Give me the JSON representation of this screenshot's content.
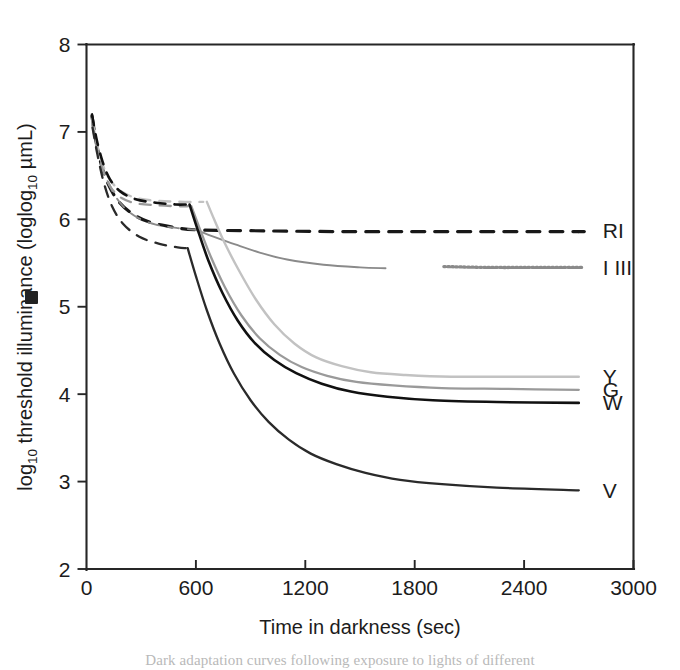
{
  "figure": {
    "caption_partial": "Dark adaptation curves following exposure to lights of different"
  },
  "chart_data": {
    "type": "line",
    "title": "",
    "xlabel": "Time in darkness (sec)",
    "ylabel": "log",
    "ylabel_sub1": "10",
    "ylabel_mid": " threshold  illuminance (log",
    "ylabel_sub2": "10",
    "ylabel_end": " µmL)",
    "ylabel_full": "log10 threshold illuminance (log10 µmL)",
    "xlim": [
      0,
      3000
    ],
    "ylim": [
      2,
      8
    ],
    "xticks": [
      0,
      600,
      1200,
      1800,
      2400,
      3000
    ],
    "yticks": [
      2,
      3,
      4,
      5,
      6,
      7,
      8
    ],
    "xtick_labels": [
      "0",
      "600",
      "1200",
      "1800",
      "2400",
      "3000"
    ],
    "ytick_labels": [
      "2",
      "3",
      "4",
      "5",
      "6",
      "7",
      "8"
    ],
    "grid": false,
    "legend_position": "right-inline-labels",
    "series": [
      {
        "name": "RI",
        "label": "RI",
        "color": "#181818",
        "style": "dashed",
        "width": 3.2,
        "label_x": 2755,
        "label_y": 5.87,
        "cone_points": [
          [
            30,
            7.18
          ],
          [
            55,
            6.86
          ],
          [
            85,
            6.6
          ],
          [
            120,
            6.4
          ],
          [
            170,
            6.22
          ],
          [
            240,
            6.08
          ],
          [
            330,
            5.98
          ],
          [
            450,
            5.92
          ],
          [
            600,
            5.88
          ],
          [
            900,
            5.87
          ],
          [
            1400,
            5.86
          ],
          [
            2000,
            5.86
          ],
          [
            2700,
            5.86
          ]
        ],
        "plateau": 5.86
      },
      {
        "name": "I III",
        "label": "I III",
        "color": "#8a8a8a",
        "style": "solid-then-dotted",
        "width": 1.9,
        "label_x": 2755,
        "label_y": 5.45,
        "cone_points": [
          [
            35,
            7.1
          ],
          [
            60,
            6.82
          ],
          [
            95,
            6.55
          ],
          [
            140,
            6.33
          ],
          [
            200,
            6.15
          ],
          [
            280,
            6.02
          ],
          [
            380,
            5.94
          ],
          [
            500,
            5.9
          ],
          [
            600,
            5.88
          ]
        ],
        "rod_points": [
          [
            600,
            5.88
          ],
          [
            700,
            5.8
          ],
          [
            820,
            5.71
          ],
          [
            950,
            5.62
          ],
          [
            1100,
            5.54
          ],
          [
            1300,
            5.48
          ],
          [
            1500,
            5.45
          ],
          [
            1640,
            5.44
          ]
        ],
        "dotted_points": [
          [
            1960,
            5.46
          ],
          [
            2200,
            5.45
          ],
          [
            2500,
            5.45
          ],
          [
            2720,
            5.45
          ]
        ],
        "plateau": 5.45
      },
      {
        "name": "Y",
        "label": "Y",
        "color": "#c2c2c2",
        "style": "solid",
        "width": 2.4,
        "label_x": 2755,
        "label_y": 4.2,
        "cone_points": [
          [
            30,
            7.15
          ],
          [
            55,
            6.88
          ],
          [
            90,
            6.62
          ],
          [
            130,
            6.45
          ],
          [
            190,
            6.32
          ],
          [
            280,
            6.24
          ],
          [
            400,
            6.21
          ],
          [
            540,
            6.2
          ],
          [
            640,
            6.2
          ]
        ],
        "rod_points": [
          [
            660,
            6.2
          ],
          [
            700,
            6.0
          ],
          [
            760,
            5.72
          ],
          [
            840,
            5.4
          ],
          [
            930,
            5.08
          ],
          [
            1030,
            4.8
          ],
          [
            1140,
            4.58
          ],
          [
            1260,
            4.42
          ],
          [
            1400,
            4.32
          ],
          [
            1560,
            4.25
          ],
          [
            1750,
            4.22
          ],
          [
            2000,
            4.2
          ],
          [
            2300,
            4.2
          ],
          [
            2700,
            4.2
          ]
        ],
        "plateau": 4.2
      },
      {
        "name": "G",
        "label": "G",
        "color": "#9a9a9a",
        "style": "solid",
        "width": 2.3,
        "label_x": 2755,
        "label_y": 4.05,
        "cone_points": [
          [
            32,
            7.08
          ],
          [
            58,
            6.8
          ],
          [
            92,
            6.55
          ],
          [
            135,
            6.36
          ],
          [
            195,
            6.24
          ],
          [
            280,
            6.18
          ],
          [
            390,
            6.16
          ],
          [
            500,
            6.15
          ],
          [
            560,
            6.15
          ]
        ],
        "rod_points": [
          [
            575,
            6.15
          ],
          [
            620,
            5.9
          ],
          [
            680,
            5.58
          ],
          [
            760,
            5.22
          ],
          [
            850,
            4.9
          ],
          [
            950,
            4.64
          ],
          [
            1060,
            4.45
          ],
          [
            1180,
            4.31
          ],
          [
            1320,
            4.21
          ],
          [
            1480,
            4.14
          ],
          [
            1680,
            4.1
          ],
          [
            1950,
            4.07
          ],
          [
            2300,
            4.06
          ],
          [
            2700,
            4.05
          ]
        ],
        "plateau": 4.05
      },
      {
        "name": "W",
        "label": "W",
        "color": "#111111",
        "style": "solid",
        "width": 2.6,
        "label_x": 2755,
        "label_y": 3.9,
        "cone_points": [
          [
            30,
            7.2
          ],
          [
            55,
            6.92
          ],
          [
            88,
            6.66
          ],
          [
            128,
            6.46
          ],
          [
            185,
            6.32
          ],
          [
            270,
            6.23
          ],
          [
            380,
            6.19
          ],
          [
            490,
            6.17
          ],
          [
            550,
            6.17
          ]
        ],
        "rod_points": [
          [
            565,
            6.17
          ],
          [
            610,
            5.88
          ],
          [
            670,
            5.52
          ],
          [
            745,
            5.16
          ],
          [
            830,
            4.84
          ],
          [
            925,
            4.58
          ],
          [
            1030,
            4.39
          ],
          [
            1150,
            4.24
          ],
          [
            1290,
            4.12
          ],
          [
            1450,
            4.03
          ],
          [
            1650,
            3.97
          ],
          [
            1900,
            3.93
          ],
          [
            2250,
            3.91
          ],
          [
            2700,
            3.9
          ]
        ],
        "plateau": 3.9
      },
      {
        "name": "V",
        "label": "V",
        "color": "#2a2a2a",
        "style": "solid",
        "width": 2.3,
        "label_x": 2755,
        "label_y": 2.9,
        "cone_points": [
          [
            33,
            7.05
          ],
          [
            60,
            6.74
          ],
          [
            95,
            6.42
          ],
          [
            140,
            6.15
          ],
          [
            200,
            5.95
          ],
          [
            290,
            5.8
          ],
          [
            400,
            5.72
          ],
          [
            500,
            5.68
          ],
          [
            545,
            5.67
          ]
        ],
        "rod_points": [
          [
            555,
            5.67
          ],
          [
            600,
            5.35
          ],
          [
            660,
            4.96
          ],
          [
            730,
            4.58
          ],
          [
            810,
            4.23
          ],
          [
            900,
            3.93
          ],
          [
            1000,
            3.68
          ],
          [
            1110,
            3.48
          ],
          [
            1230,
            3.32
          ],
          [
            1370,
            3.2
          ],
          [
            1530,
            3.1
          ],
          [
            1720,
            3.02
          ],
          [
            1950,
            2.97
          ],
          [
            2250,
            2.93
          ],
          [
            2700,
            2.9
          ]
        ],
        "plateau": 2.9
      }
    ]
  }
}
